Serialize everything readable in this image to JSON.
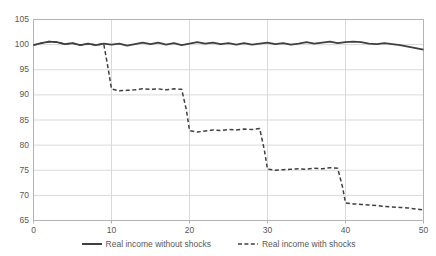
{
  "chart_data": {
    "type": "line",
    "title": "",
    "xlabel": "",
    "ylabel": "",
    "xlim": [
      0,
      50
    ],
    "ylim": [
      65,
      105
    ],
    "xticks": [
      0,
      10,
      20,
      30,
      40,
      50
    ],
    "yticks": [
      65,
      70,
      75,
      80,
      85,
      90,
      95,
      100,
      105
    ],
    "grid": true,
    "legend_position": "bottom",
    "series": [
      {
        "name": "Real income without shocks",
        "style": "solid",
        "color": "#3f3f3f",
        "x": [
          0,
          1,
          2,
          3,
          4,
          5,
          6,
          7,
          8,
          9,
          10,
          11,
          12,
          13,
          14,
          15,
          16,
          17,
          18,
          19,
          20,
          21,
          22,
          23,
          24,
          25,
          26,
          27,
          28,
          29,
          30,
          31,
          32,
          33,
          34,
          35,
          36,
          37,
          38,
          39,
          40,
          41,
          42,
          43,
          44,
          45,
          46,
          47,
          48,
          49,
          50
        ],
        "values": [
          99.9,
          100.3,
          100.6,
          100.5,
          100.1,
          100.3,
          99.9,
          100.2,
          99.9,
          100.2,
          100.0,
          100.2,
          99.8,
          100.1,
          100.4,
          100.1,
          100.4,
          100.0,
          100.3,
          99.9,
          100.2,
          100.5,
          100.2,
          100.4,
          100.1,
          100.3,
          100.0,
          100.3,
          100.0,
          100.2,
          100.4,
          100.1,
          100.3,
          100.0,
          100.2,
          100.5,
          100.2,
          100.4,
          100.6,
          100.3,
          100.5,
          100.6,
          100.5,
          100.2,
          100.1,
          100.3,
          100.1,
          99.9,
          99.6,
          99.3,
          99.0
        ]
      },
      {
        "name": "Real income with shocks",
        "style": "dashed",
        "color": "#3f3f3f",
        "x": [
          0,
          1,
          2,
          3,
          4,
          5,
          6,
          7,
          8,
          9,
          9.6,
          10,
          11,
          12,
          13,
          14,
          15,
          16,
          17,
          18,
          19,
          19.6,
          20,
          21,
          22,
          23,
          24,
          25,
          26,
          27,
          28,
          29,
          29.6,
          30,
          31,
          32,
          33,
          34,
          35,
          36,
          37,
          38,
          39,
          39.6,
          40,
          41,
          42,
          43,
          44,
          45,
          46,
          47,
          48,
          49,
          50
        ],
        "values": [
          99.9,
          100.3,
          100.6,
          100.5,
          100.1,
          100.3,
          99.9,
          100.2,
          99.9,
          100.2,
          95.0,
          91.2,
          90.8,
          90.9,
          91.0,
          91.2,
          91.1,
          91.2,
          91.0,
          91.2,
          91.1,
          87.0,
          82.9,
          82.6,
          82.8,
          83.0,
          82.9,
          83.1,
          83.0,
          83.2,
          83.1,
          83.3,
          79.0,
          75.2,
          75.0,
          75.1,
          75.2,
          75.3,
          75.2,
          75.4,
          75.3,
          75.5,
          75.4,
          71.8,
          68.5,
          68.3,
          68.2,
          68.1,
          68.0,
          67.8,
          67.7,
          67.6,
          67.5,
          67.3,
          67.1
        ]
      }
    ]
  },
  "legend": {
    "entries": [
      {
        "label": "Real income without shocks",
        "marker": "solid-line-marker"
      },
      {
        "label": "Real income with shocks",
        "marker": "dashed-line-marker"
      }
    ]
  },
  "axes": {
    "y_labels": [
      "105",
      "100",
      "95",
      "90",
      "85",
      "80",
      "75",
      "70",
      "65"
    ],
    "x_labels": [
      "0",
      "10",
      "20",
      "30",
      "40",
      "50"
    ]
  },
  "colors": {
    "line": "#3f3f3f",
    "grid": "#d9d9d9",
    "axis": "#b3b3b3",
    "text": "#585858",
    "background": "#ffffff"
  }
}
